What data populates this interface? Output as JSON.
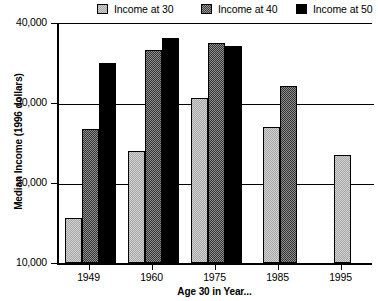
{
  "chart_data": {
    "type": "bar",
    "title": "",
    "xlabel": "Age 30 in Year...",
    "ylabel": "Median Income (1996 dollars)",
    "categories": [
      "1949",
      "1960",
      "1975",
      "1985",
      "1995"
    ],
    "series": [
      {
        "name": "Income at 30",
        "values": [
          15600,
          24000,
          30600,
          27000,
          23500
        ],
        "color": "#a6a6a6",
        "pattern": "light-checker"
      },
      {
        "name": "Income at 40",
        "values": [
          26700,
          36600,
          37500,
          32100,
          null
        ],
        "color": "#333333",
        "pattern": "dark-checker"
      },
      {
        "name": "Income at 50",
        "values": [
          35000,
          38100,
          37100,
          null,
          null
        ],
        "color": "#000000",
        "pattern": "solid"
      }
    ],
    "ylim": [
      10000,
      40000
    ],
    "yticks": [
      10000,
      20000,
      30000,
      40000
    ],
    "ytick_labels": [
      "10,000",
      "20,000",
      "30,000",
      "40,000"
    ],
    "grid": true,
    "legend_position": "top"
  },
  "legend": {
    "items": [
      {
        "label": "Income at 30",
        "swatch": "light-checker-swatch"
      },
      {
        "label": "Income at 40",
        "swatch": "dark-checker-swatch"
      },
      {
        "label": "Income at 50",
        "swatch": "black-swatch"
      }
    ]
  },
  "axes": {
    "y_title": "Median Income (1996 dollars)",
    "x_title": "Age 30 in Year...",
    "y_tick_labels": [
      "40,000",
      "30,000",
      "20,000",
      "10,000"
    ],
    "x_tick_labels": [
      "1949",
      "1960",
      "1975",
      "1985",
      "1995"
    ]
  }
}
